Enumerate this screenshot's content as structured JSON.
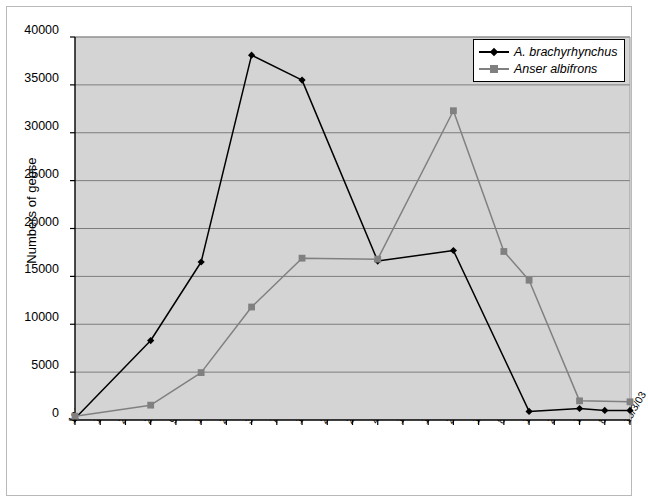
{
  "chart_data": {
    "type": "line",
    "title": "",
    "xlabel": "",
    "ylabel": "Numbers of geese",
    "ylim": [
      0,
      40000
    ],
    "ytick_step": 5000,
    "yticks": [
      "40000",
      "35000",
      "30000",
      "25000",
      "20000",
      "15000",
      "10000",
      "5000",
      "0"
    ],
    "grid": true,
    "legend_position": "top-right",
    "plot_background": "#d4d4d4",
    "categories": [
      "12/10/02",
      "19/10/02",
      "26/10/02",
      "2/11/02",
      "9/11/02",
      "16/11/02",
      "23/11/02",
      "30/11/02",
      "7/12/02",
      "14/12/02",
      "21/12/02",
      "28/12/02",
      "4/1/03",
      "11/1/03",
      "18/1/03",
      "25/1/03",
      "1/2/03",
      "8/2/03",
      "15/2/03",
      "22/2/03",
      "1/3/03",
      "8/3/03",
      "15/3/03"
    ],
    "series": [
      {
        "name": "A. brachyrhynchus",
        "color": "#000000",
        "marker": "diamond",
        "values": [
          150,
          null,
          null,
          8300,
          null,
          16500,
          null,
          38100,
          null,
          35500,
          null,
          null,
          16600,
          null,
          null,
          17700,
          null,
          null,
          900,
          null,
          1200,
          1000,
          1000
        ]
      },
      {
        "name": "Anser albifrons",
        "color": "#808080",
        "marker": "square",
        "values": [
          400,
          null,
          null,
          1550,
          null,
          4950,
          null,
          11800,
          null,
          16900,
          null,
          null,
          16800,
          null,
          null,
          32300,
          null,
          17600,
          14600,
          null,
          2000,
          null,
          1900
        ]
      }
    ]
  },
  "legend": {
    "items": [
      {
        "label": "A. brachyrhynchus",
        "color": "#000000",
        "marker": "diamond-marker-icon"
      },
      {
        "label": "Anser albifrons",
        "color": "#808080",
        "marker": "square-marker-icon"
      }
    ]
  }
}
